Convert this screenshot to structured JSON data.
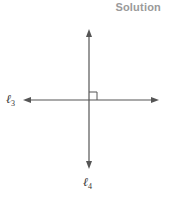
{
  "heading": "Solution",
  "diagram": {
    "lines": [
      {
        "id": "l3",
        "label_symbol": "ℓ",
        "label_subscript": "3",
        "orientation": "horizontal",
        "arrows": "both"
      },
      {
        "id": "l4",
        "label_symbol": "ℓ",
        "label_subscript": "4",
        "orientation": "vertical",
        "arrows": "both"
      }
    ],
    "right_angle_marker": true,
    "colors": {
      "line": "#555555",
      "heading": "#9a9a9a",
      "label": "#333333"
    }
  }
}
